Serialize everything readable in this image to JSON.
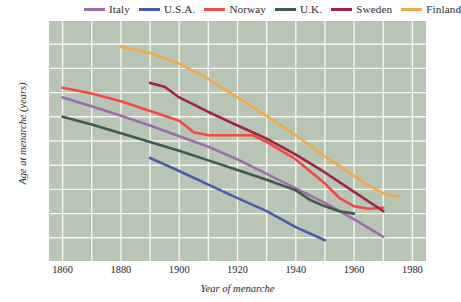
{
  "chart_data": {
    "type": "line",
    "title": "",
    "xlabel": "Year of menarche",
    "ylabel": "Age at menarche (years)",
    "xlim": [
      1855,
      1985
    ],
    "ylim": [
      12.0,
      17.0
    ],
    "grid": true,
    "legend_position": "top",
    "xticks": [
      1860,
      1880,
      1900,
      1920,
      1940,
      1960,
      1980
    ],
    "yticks": [
      "17.0",
      "16.5",
      "16.0",
      "15.5",
      "15.0",
      "14.5",
      "14.0",
      "13.5",
      "13.0",
      "12.5",
      "12.0"
    ],
    "background_color": "#b9c5b4",
    "gridline_color": "#f2f5f0",
    "series": [
      {
        "name": "Italy",
        "color": "#9b6fae",
        "x": [
          1860,
          1870,
          1880,
          1890,
          1900,
          1910,
          1920,
          1930,
          1940,
          1950,
          1960,
          1970
        ],
        "y": [
          15.4,
          15.22,
          15.02,
          14.82,
          14.6,
          14.38,
          14.12,
          13.82,
          13.52,
          13.22,
          12.88,
          12.52
        ]
      },
      {
        "name": "U.S.A.",
        "color": "#4a5ea8",
        "x": [
          1890,
          1900,
          1910,
          1920,
          1930,
          1940,
          1950
        ],
        "y": [
          14.15,
          13.88,
          13.6,
          13.32,
          13.05,
          12.72,
          12.45
        ]
      },
      {
        "name": "Norway",
        "color": "#ef4a43",
        "x": [
          1860,
          1870,
          1880,
          1890,
          1900,
          1905,
          1910,
          1915,
          1925,
          1930,
          1940,
          1950,
          1955,
          1960,
          1965,
          1970
        ],
        "y": [
          15.6,
          15.48,
          15.32,
          15.12,
          14.92,
          14.68,
          14.62,
          14.62,
          14.62,
          14.48,
          14.12,
          13.62,
          13.32,
          13.15,
          13.1,
          13.12
        ]
      },
      {
        "name": "U.K.",
        "color": "#3d5c4c",
        "x": [
          1860,
          1870,
          1880,
          1890,
          1900,
          1910,
          1920,
          1930,
          1940,
          1945,
          1950,
          1955,
          1960
        ],
        "y": [
          15.0,
          14.84,
          14.66,
          14.48,
          14.3,
          14.1,
          13.9,
          13.7,
          13.48,
          13.28,
          13.15,
          13.05,
          13.0
        ]
      },
      {
        "name": "Sweden",
        "color": "#9e2545",
        "x": [
          1890,
          1895,
          1900,
          1910,
          1920,
          1930,
          1940,
          1950,
          1960,
          1965,
          1970
        ],
        "y": [
          15.7,
          15.62,
          15.4,
          15.1,
          14.82,
          14.55,
          14.22,
          13.85,
          13.45,
          13.25,
          13.05
        ]
      },
      {
        "name": "Finland",
        "color": "#f0a94c",
        "x": [
          1880,
          1890,
          1900,
          1910,
          1920,
          1930,
          1940,
          1950,
          1960,
          1965,
          1970,
          1975
        ],
        "y": [
          16.45,
          16.32,
          16.1,
          15.78,
          15.4,
          15.02,
          14.62,
          14.18,
          13.78,
          13.58,
          13.42,
          13.35
        ]
      }
    ]
  },
  "legend": {
    "items": [
      {
        "label": "Italy",
        "color": "#9b6fae"
      },
      {
        "label": "U.S.A.",
        "color": "#4a5ea8"
      },
      {
        "label": "Norway",
        "color": "#ef4a43"
      },
      {
        "label": "U.K.",
        "color": "#3d5c4c"
      },
      {
        "label": "Sweden",
        "color": "#9e2545"
      },
      {
        "label": "Finland",
        "color": "#f0a94c"
      }
    ]
  },
  "axes": {
    "y_title": "Age at menarche (years)",
    "x_title": "Year of menarche",
    "y_ticks": [
      "17.0",
      "16.5",
      "16.0",
      "15.5",
      "15.0",
      "14.5",
      "14.0",
      "13.5",
      "13.0",
      "12.5",
      "12.0"
    ],
    "x_ticks": [
      "1860",
      "1880",
      "1900",
      "1920",
      "1940",
      "1960",
      "1980"
    ]
  }
}
